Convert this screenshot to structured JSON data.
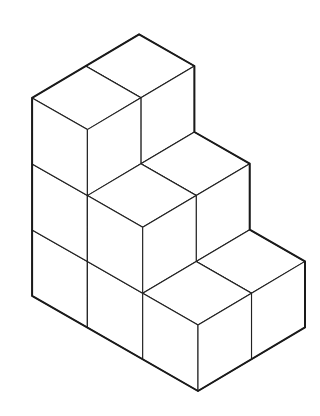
{
  "diagram": {
    "type": "isometric-cube-staircase",
    "cube_count": 12,
    "colors": {
      "background": "#ffffff",
      "line": "#222222",
      "outline": "#1a1a1a",
      "face": "#ffffff"
    },
    "projection": {
      "origin": [
        198,
        391
      ],
      "u": [
        -55.3,
        -31.7
      ],
      "v": [
        53.5,
        -31.8
      ],
      "h": [
        0,
        -66
      ]
    },
    "base": {
      "width_u": 3,
      "depth_v": 2
    },
    "column_heights": [
      {
        "u": 0,
        "v": 0,
        "height": 1
      },
      {
        "u": 0,
        "v": 1,
        "height": 1
      },
      {
        "u": 1,
        "v": 0,
        "height": 2
      },
      {
        "u": 1,
        "v": 1,
        "height": 2
      },
      {
        "u": 2,
        "v": 0,
        "height": 3
      },
      {
        "u": 2,
        "v": 1,
        "height": 3
      }
    ]
  }
}
